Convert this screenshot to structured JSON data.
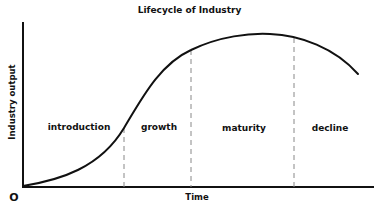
{
  "diagram": {
    "title": "Lifecycle of Industry",
    "y_axis_label": "Industry output",
    "x_axis_label": "Time",
    "origin_label": "O",
    "phases": [
      {
        "label": "introduction"
      },
      {
        "label": "growth"
      },
      {
        "label": "maturity"
      },
      {
        "label": "decline"
      }
    ],
    "colors": {
      "curve": "#111111",
      "axis": "#111111",
      "divider": "#888888",
      "background": "#ffffff"
    }
  }
}
